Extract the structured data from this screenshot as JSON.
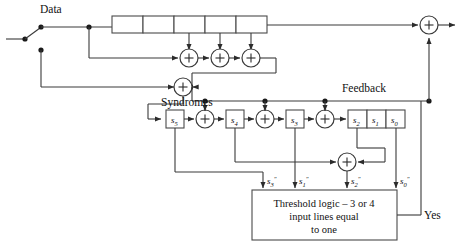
{
  "figure": {
    "type": "majority-logic-decoder-block-diagram",
    "labels": {
      "data": "Data",
      "feedback": "Feedback",
      "syndromes": "Syndromes",
      "yes": "Yes"
    },
    "threshold_box": {
      "line1": "Threshold logic – 3 or 4",
      "line2": "input lines equal",
      "line3": "to one"
    },
    "data_register": {
      "name": "data-shift-register",
      "cell_count": 5,
      "cells": [
        "",
        "",
        "",
        "",
        ""
      ]
    },
    "syndrome_registers": [
      {
        "name": "s5",
        "base": "s",
        "sub": "5"
      },
      {
        "name": "s4",
        "base": "s",
        "sub": "4"
      },
      {
        "name": "s3",
        "base": "s",
        "sub": "3"
      },
      {
        "name": "s2",
        "base": "s",
        "sub": "2"
      },
      {
        "name": "s1",
        "base": "s",
        "sub": "1"
      },
      {
        "name": "s0",
        "base": "s",
        "sub": "0"
      }
    ],
    "threshold_inputs": [
      {
        "name": "s3-double-prime",
        "base": "s",
        "sub": "3",
        "prime": "″"
      },
      {
        "name": "s1-double-prime",
        "base": "s",
        "sub": "1",
        "prime": "″"
      },
      {
        "name": "s2-double-prime",
        "base": "s",
        "sub": "2",
        "prime": "″"
      },
      {
        "name": "s0-double-prime",
        "base": "s",
        "sub": "0",
        "prime": "″"
      }
    ],
    "adders": [
      {
        "name": "top-adder-1",
        "symbol": "+"
      },
      {
        "name": "top-adder-2",
        "symbol": "+"
      },
      {
        "name": "top-adder-3",
        "symbol": "+"
      },
      {
        "name": "input-adder",
        "symbol": "+"
      },
      {
        "name": "syndrome-adder-1",
        "symbol": "+"
      },
      {
        "name": "syndrome-adder-2",
        "symbol": "+"
      },
      {
        "name": "syndrome-adder-3",
        "symbol": "+"
      },
      {
        "name": "majority-adder",
        "symbol": "+"
      },
      {
        "name": "output-adder",
        "symbol": "+"
      }
    ],
    "colors": {
      "wire": "#3a3a3a",
      "box": "#4a4a4a",
      "text": "#111111",
      "background": "#ffffff"
    }
  }
}
